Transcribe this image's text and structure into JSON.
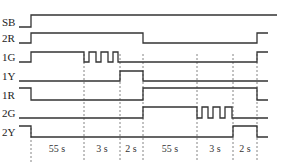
{
  "diagram": {
    "type": "timing-diagram",
    "signals": [
      {
        "name": "SB",
        "y_low": 27,
        "y_high": 15,
        "points": [
          [
            19,
            "L"
          ],
          [
            31,
            "H"
          ],
          [
            277,
            "H"
          ]
        ]
      },
      {
        "name": "2R",
        "y_low": 43,
        "y_high": 33,
        "points": [
          [
            19,
            "L"
          ],
          [
            31,
            "H"
          ],
          [
            143,
            "L"
          ],
          [
            257,
            "H"
          ],
          [
            268,
            "H"
          ]
        ]
      },
      {
        "name": "1G",
        "y_low": 62,
        "y_high": 52,
        "points": [
          [
            19,
            "L"
          ],
          [
            31,
            "H"
          ],
          [
            84,
            "L"
          ],
          [
            89,
            "H"
          ],
          [
            96,
            "L"
          ],
          [
            101,
            "H"
          ],
          [
            108,
            "L"
          ],
          [
            113,
            "H"
          ],
          [
            118,
            "L"
          ],
          [
            143,
            "L"
          ],
          [
            257,
            "H"
          ],
          [
            268,
            "H"
          ]
        ]
      },
      {
        "name": "1Y",
        "y_low": 81,
        "y_high": 71,
        "points": [
          [
            19,
            "L"
          ],
          [
            120,
            "H"
          ],
          [
            143,
            "L"
          ],
          [
            268,
            "L"
          ]
        ]
      },
      {
        "name": "1R",
        "y_low": 100,
        "y_high": 88,
        "points": [
          [
            19,
            "H"
          ],
          [
            31,
            "L"
          ],
          [
            143,
            "H"
          ],
          [
            257,
            "L"
          ],
          [
            268,
            "L"
          ]
        ]
      },
      {
        "name": "2G",
        "y_low": 118,
        "y_high": 107,
        "points": [
          [
            19,
            "L"
          ],
          [
            143,
            "H"
          ],
          [
            197,
            "L"
          ],
          [
            202,
            "H"
          ],
          [
            208,
            "L"
          ],
          [
            213,
            "H"
          ],
          [
            220,
            "L"
          ],
          [
            225,
            "H"
          ],
          [
            232,
            "L"
          ],
          [
            268,
            "L"
          ]
        ]
      },
      {
        "name": "2Y",
        "y_low": 137,
        "y_high": 126,
        "points": [
          [
            19,
            "H"
          ],
          [
            31,
            "L"
          ],
          [
            233,
            "H"
          ],
          [
            257,
            "L"
          ],
          [
            268,
            "L"
          ]
        ]
      }
    ],
    "time_markers_x": [
      31,
      84,
      120,
      143,
      197,
      233,
      257
    ],
    "durations": [
      {
        "label": "55 s",
        "x": 57
      },
      {
        "label": "3 s",
        "x": 102
      },
      {
        "label": "2 s",
        "x": 131
      },
      {
        "label": "55 s",
        "x": 170
      },
      {
        "label": "3 s",
        "x": 215
      },
      {
        "label": "2 s",
        "x": 245
      }
    ]
  }
}
